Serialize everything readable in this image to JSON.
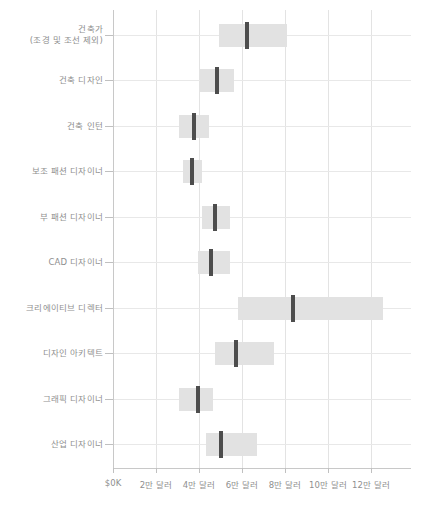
{
  "chart_data": {
    "type": "bar",
    "subtype": "range-bar-with-median",
    "title": "",
    "subtitle": "",
    "xlabel": "",
    "ylabel": "",
    "orientation": "horizontal",
    "grid": true,
    "legend": null,
    "xlim": [
      0,
      130000
    ],
    "x_unit": "USD",
    "x_ticks": [
      0,
      20000,
      40000,
      60000,
      80000,
      100000,
      120000
    ],
    "x_tick_labels": [
      "$0K",
      "2만 달러",
      "4만 달러",
      "6만 달러",
      "8만 달러",
      "10만 달러",
      "12만 달러"
    ],
    "categories": [
      "건축가\n(조경 및 조선 제외)",
      "건축 디자인",
      "건축 인턴",
      "보조 패션 디자이너",
      "부 패션 디자이너",
      "CAD 디자이너",
      "크리에이티브 디렉터",
      "디자인 아키텍트",
      "그래픽 디자이너",
      "산업 디자이너"
    ],
    "series": [
      {
        "name": "급여 범위",
        "low": [
          50000,
          41000,
          31000,
          33000,
          42000,
          40000,
          59000,
          48000,
          31000,
          44000
        ],
        "high": [
          82000,
          57000,
          45000,
          42000,
          55000,
          55000,
          127000,
          76000,
          47000,
          68000
        ],
        "median": [
          63000,
          49000,
          38000,
          37000,
          48000,
          46000,
          85000,
          58000,
          40000,
          51000
        ]
      }
    ],
    "colors": {
      "bar_fill": "#e2e2e2",
      "median_line": "#4d4d4d",
      "gridline": "#e3e3e3",
      "axis": "#c8c8c8",
      "text": "#8f8f8f",
      "background": "#ffffff"
    }
  }
}
